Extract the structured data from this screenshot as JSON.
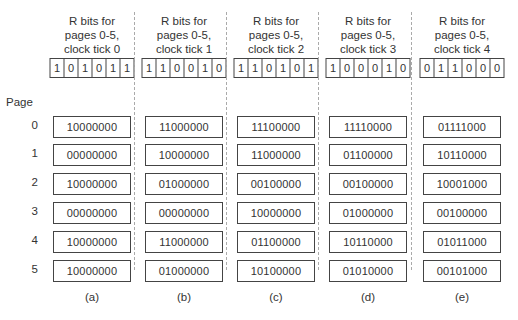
{
  "page_label": "Page",
  "pages": [
    "0",
    "1",
    "2",
    "3",
    "4",
    "5"
  ],
  "columns": [
    {
      "title_lines": [
        "R bits for",
        "pages 0-5,",
        "clock tick 0"
      ],
      "r_bits": [
        "1",
        "0",
        "1",
        "0",
        "1",
        "1"
      ],
      "counters": [
        "10000000",
        "00000000",
        "10000000",
        "00000000",
        "10000000",
        "10000000"
      ],
      "caption": "(a)"
    },
    {
      "title_lines": [
        "R bits for",
        "pages 0-5,",
        "clock tick 1"
      ],
      "r_bits": [
        "1",
        "1",
        "0",
        "0",
        "1",
        "0"
      ],
      "counters": [
        "11000000",
        "10000000",
        "01000000",
        "00000000",
        "11000000",
        "01000000"
      ],
      "caption": "(b)"
    },
    {
      "title_lines": [
        "R bits for",
        "pages 0-5,",
        "clock tick 2"
      ],
      "r_bits": [
        "1",
        "1",
        "0",
        "1",
        "0",
        "1"
      ],
      "counters": [
        "11100000",
        "11000000",
        "00100000",
        "10000000",
        "01100000",
        "10100000"
      ],
      "caption": "(c)"
    },
    {
      "title_lines": [
        "R bits for",
        "pages 0-5,",
        "clock tick 3"
      ],
      "r_bits": [
        "1",
        "0",
        "0",
        "0",
        "1",
        "0"
      ],
      "counters": [
        "11110000",
        "01100000",
        "00100000",
        "01000000",
        "10110000",
        "01010000"
      ],
      "caption": "(d)"
    },
    {
      "title_lines": [
        "R bits for",
        "pages 0-5,",
        "clock tick 4"
      ],
      "r_bits": [
        "0",
        "1",
        "1",
        "0",
        "0",
        "0"
      ],
      "counters": [
        "01111000",
        "10110000",
        "10001000",
        "00100000",
        "01011000",
        "00101000"
      ],
      "caption": "(e)"
    }
  ]
}
